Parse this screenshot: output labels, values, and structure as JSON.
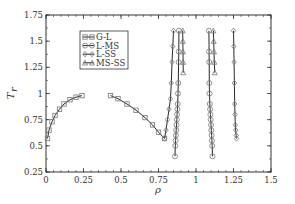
{
  "chart_data": {
    "type": "line",
    "title": "",
    "xlabel": "ρ",
    "ylabel": "T_r",
    "xlim": [
      0,
      1.5
    ],
    "ylim": [
      0.25,
      1.75
    ],
    "grid": false,
    "legend_position": "upper-left-inside",
    "xticks": [
      "0",
      "0.25",
      "0.5",
      "0.75",
      "1",
      "1.25",
      "1.5"
    ],
    "yticks": [
      "0.25",
      "0.5",
      "0.75",
      "1",
      "1.25",
      "1.5",
      "1.75"
    ],
    "series": [
      {
        "name": "G-L",
        "marker": "square",
        "segments": [
          {
            "x": [
              0.01,
              0.02,
              0.04,
              0.06,
              0.09,
              0.12,
              0.16,
              0.2,
              0.24
            ],
            "y": [
              0.57,
              0.65,
              0.73,
              0.79,
              0.85,
              0.9,
              0.94,
              0.965,
              0.98
            ]
          },
          {
            "x": [
              0.43,
              0.48,
              0.54,
              0.6,
              0.66,
              0.71,
              0.75,
              0.79
            ],
            "y": [
              0.98,
              0.95,
              0.9,
              0.84,
              0.77,
              0.7,
              0.63,
              0.57
            ]
          }
        ]
      },
      {
        "name": "L-MS",
        "marker": "circle",
        "segments": [
          {
            "x": [
              0.86,
              0.862,
              0.864,
              0.866,
              0.868,
              0.87,
              0.872,
              0.874,
              0.876,
              0.878,
              0.88,
              0.882,
              0.884,
              0.885,
              0.886
            ],
            "y": [
              0.4,
              0.5,
              0.55,
              0.6,
              0.65,
              0.7,
              0.75,
              0.8,
              0.85,
              0.9,
              1.0,
              1.1,
              1.3,
              1.4,
              1.6
            ]
          },
          {
            "x": [
              1.11,
              1.108,
              1.106,
              1.104,
              1.102,
              1.1,
              1.098,
              1.096,
              1.094,
              1.092,
              1.09,
              1.089,
              1.088,
              1.087,
              1.086
            ],
            "y": [
              0.4,
              0.5,
              0.55,
              0.6,
              0.65,
              0.7,
              0.75,
              0.8,
              0.85,
              0.9,
              1.0,
              1.1,
              1.3,
              1.4,
              1.6
            ]
          }
        ]
      },
      {
        "name": "L-SS",
        "marker": "diamond",
        "segments": [
          {
            "x": [
              0.79,
              0.8,
              0.81,
              0.82,
              0.83,
              0.835,
              0.84,
              0.845,
              0.85
            ],
            "y": [
              0.57,
              0.65,
              0.75,
              0.85,
              0.95,
              1.1,
              1.3,
              1.45,
              1.6
            ]
          },
          {
            "x": [
              1.27,
              1.268,
              1.265,
              1.262,
              1.26,
              1.258,
              1.256,
              1.254,
              1.252,
              1.25
            ],
            "y": [
              0.57,
              0.6,
              0.65,
              0.7,
              0.8,
              0.9,
              1.1,
              1.3,
              1.45,
              1.6
            ]
          }
        ]
      },
      {
        "name": "MS-SS",
        "marker": "triangle",
        "segments": [
          {
            "x": [
              0.915,
              0.914,
              0.913,
              0.912,
              0.911
            ],
            "y": [
              1.2,
              1.3,
              1.4,
              1.5,
              1.6
            ]
          },
          {
            "x": [
              1.125,
              1.122,
              1.12,
              1.118,
              1.116
            ],
            "y": [
              1.2,
              1.3,
              1.4,
              1.5,
              1.6
            ]
          }
        ]
      }
    ]
  },
  "colors": {
    "axis": "#333333",
    "line": "#2a2a2a",
    "marker": "#777777"
  }
}
